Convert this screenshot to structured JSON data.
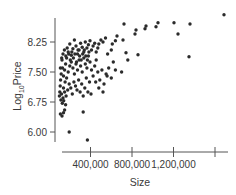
{
  "chart_data": {
    "type": "scatter",
    "title": "",
    "xlabel": "Size",
    "ylabel": "Log10Price",
    "ylabel_main": "Log",
    "ylabel_sub": "10",
    "ylabel_rest": "Price",
    "xlim": [
      0,
      1750000
    ],
    "ylim": [
      5.7,
      9.0
    ],
    "x_ticks": [
      {
        "value": 400000,
        "label": "400,000"
      },
      {
        "value": 800000,
        "label": "800,000"
      },
      {
        "value": 1200000,
        "label": "1,200,000"
      },
      {
        "value": 1600000,
        "label": ""
      }
    ],
    "y_ticks": [
      {
        "value": 6.0,
        "label": "6.00"
      },
      {
        "value": 6.75,
        "label": "6.75"
      },
      {
        "value": 7.5,
        "label": "7.50"
      },
      {
        "value": 8.25,
        "label": "8.25"
      }
    ],
    "grid": false,
    "legend": null,
    "point_color": "#2b2b2b",
    "points": [
      [
        1687000,
        8.93
      ],
      [
        1359000,
        8.7
      ],
      [
        1205000,
        8.73
      ],
      [
        1243000,
        8.45
      ],
      [
        1051000,
        8.73
      ],
      [
        1031000,
        8.63
      ],
      [
        925000,
        8.58
      ],
      [
        935000,
        8.65
      ],
      [
        839000,
        8.55
      ],
      [
        713000,
        8.3
      ],
      [
        723000,
        8.7
      ],
      [
        1349000,
        7.88
      ],
      [
        858000,
        7.93
      ],
      [
        742000,
        7.98
      ],
      [
        829000,
        8.45
      ],
      [
        655000,
        8.4
      ],
      [
        640000,
        8.28
      ],
      [
        610000,
        8.2
      ],
      [
        600000,
        8.05
      ],
      [
        565000,
        7.95
      ],
      [
        545000,
        8.35
      ],
      [
        520000,
        8.25
      ],
      [
        500000,
        8.3
      ],
      [
        480000,
        8.2
      ],
      [
        470000,
        8.1
      ],
      [
        455000,
        8.0
      ],
      [
        440000,
        8.22
      ],
      [
        425000,
        8.15
      ],
      [
        410000,
        8.05
      ],
      [
        395000,
        8.28
      ],
      [
        380000,
        8.18
      ],
      [
        365000,
        8.1
      ],
      [
        350000,
        8.25
      ],
      [
        335000,
        8.0
      ],
      [
        320000,
        8.12
      ],
      [
        305000,
        8.22
      ],
      [
        290000,
        8.05
      ],
      [
        275000,
        7.95
      ],
      [
        260000,
        8.15
      ],
      [
        245000,
        8.3
      ],
      [
        230000,
        8.08
      ],
      [
        215000,
        7.92
      ],
      [
        200000,
        8.2
      ],
      [
        185000,
        8.0
      ],
      [
        170000,
        7.85
      ],
      [
        160000,
        7.7
      ],
      [
        150000,
        7.55
      ],
      [
        140000,
        7.4
      ],
      [
        130000,
        7.6
      ],
      [
        125000,
        7.8
      ],
      [
        118000,
        7.45
      ],
      [
        112000,
        7.3
      ],
      [
        108000,
        7.15
      ],
      [
        104000,
        7.0
      ],
      [
        100000,
        6.9
      ],
      [
        140000,
        7.1
      ],
      [
        155000,
        7.25
      ],
      [
        170000,
        7.35
      ],
      [
        185000,
        7.5
      ],
      [
        200000,
        7.65
      ],
      [
        215000,
        7.75
      ],
      [
        230000,
        7.6
      ],
      [
        245000,
        7.45
      ],
      [
        260000,
        7.7
      ],
      [
        275000,
        7.55
      ],
      [
        290000,
        7.8
      ],
      [
        305000,
        7.65
      ],
      [
        320000,
        7.5
      ],
      [
        335000,
        7.85
      ],
      [
        350000,
        7.7
      ],
      [
        365000,
        7.6
      ],
      [
        380000,
        7.9
      ],
      [
        395000,
        7.75
      ],
      [
        410000,
        7.55
      ],
      [
        425000,
        7.4
      ],
      [
        440000,
        7.65
      ],
      [
        455000,
        7.8
      ],
      [
        470000,
        7.5
      ],
      [
        490000,
        7.3
      ],
      [
        510000,
        7.55
      ],
      [
        530000,
        7.2
      ],
      [
        550000,
        7.45
      ],
      [
        575000,
        7.6
      ],
      [
        600000,
        7.35
      ],
      [
        620000,
        7.75
      ],
      [
        120000,
        6.95
      ],
      [
        135000,
        6.85
      ],
      [
        150000,
        7.0
      ],
      [
        165000,
        6.9
      ],
      [
        180000,
        7.05
      ],
      [
        195000,
        7.2
      ],
      [
        210000,
        7.1
      ],
      [
        225000,
        6.95
      ],
      [
        240000,
        7.25
      ],
      [
        255000,
        7.15
      ],
      [
        270000,
        7.05
      ],
      [
        285000,
        7.3
      ],
      [
        300000,
        7.0
      ],
      [
        315000,
        7.2
      ],
      [
        330000,
        6.9
      ],
      [
        345000,
        7.1
      ],
      [
        360000,
        7.35
      ],
      [
        375000,
        7.0
      ],
      [
        390000,
        7.25
      ],
      [
        405000,
        6.95
      ],
      [
        110000,
        7.6
      ],
      [
        122000,
        7.85
      ],
      [
        135000,
        7.95
      ],
      [
        148000,
        8.05
      ],
      [
        162000,
        7.9
      ],
      [
        175000,
        8.1
      ],
      [
        190000,
        7.95
      ],
      [
        205000,
        7.8
      ],
      [
        220000,
        8.0
      ],
      [
        235000,
        7.85
      ],
      [
        250000,
        7.95
      ],
      [
        265000,
        7.75
      ],
      [
        280000,
        8.05
      ],
      [
        295000,
        7.9
      ],
      [
        310000,
        7.8
      ],
      [
        325000,
        7.95
      ],
      [
        340000,
        8.05
      ],
      [
        355000,
        7.9
      ],
      [
        370000,
        7.8
      ],
      [
        385000,
        8.0
      ],
      [
        115000,
        6.8
      ],
      [
        128000,
        6.72
      ],
      [
        142000,
        6.78
      ],
      [
        160000,
        6.68
      ],
      [
        110000,
        6.45
      ],
      [
        125000,
        6.4
      ],
      [
        140000,
        6.48
      ],
      [
        150000,
        6.55
      ],
      [
        330000,
        6.5
      ],
      [
        195000,
        6.0
      ],
      [
        370000,
        5.8
      ],
      [
        450000,
        7.25
      ],
      [
        480000,
        7.1
      ],
      [
        520000,
        7.0
      ],
      [
        560000,
        7.4
      ],
      [
        640000,
        7.55
      ],
      [
        700000,
        7.5
      ],
      [
        760000,
        7.8
      ]
    ]
  }
}
